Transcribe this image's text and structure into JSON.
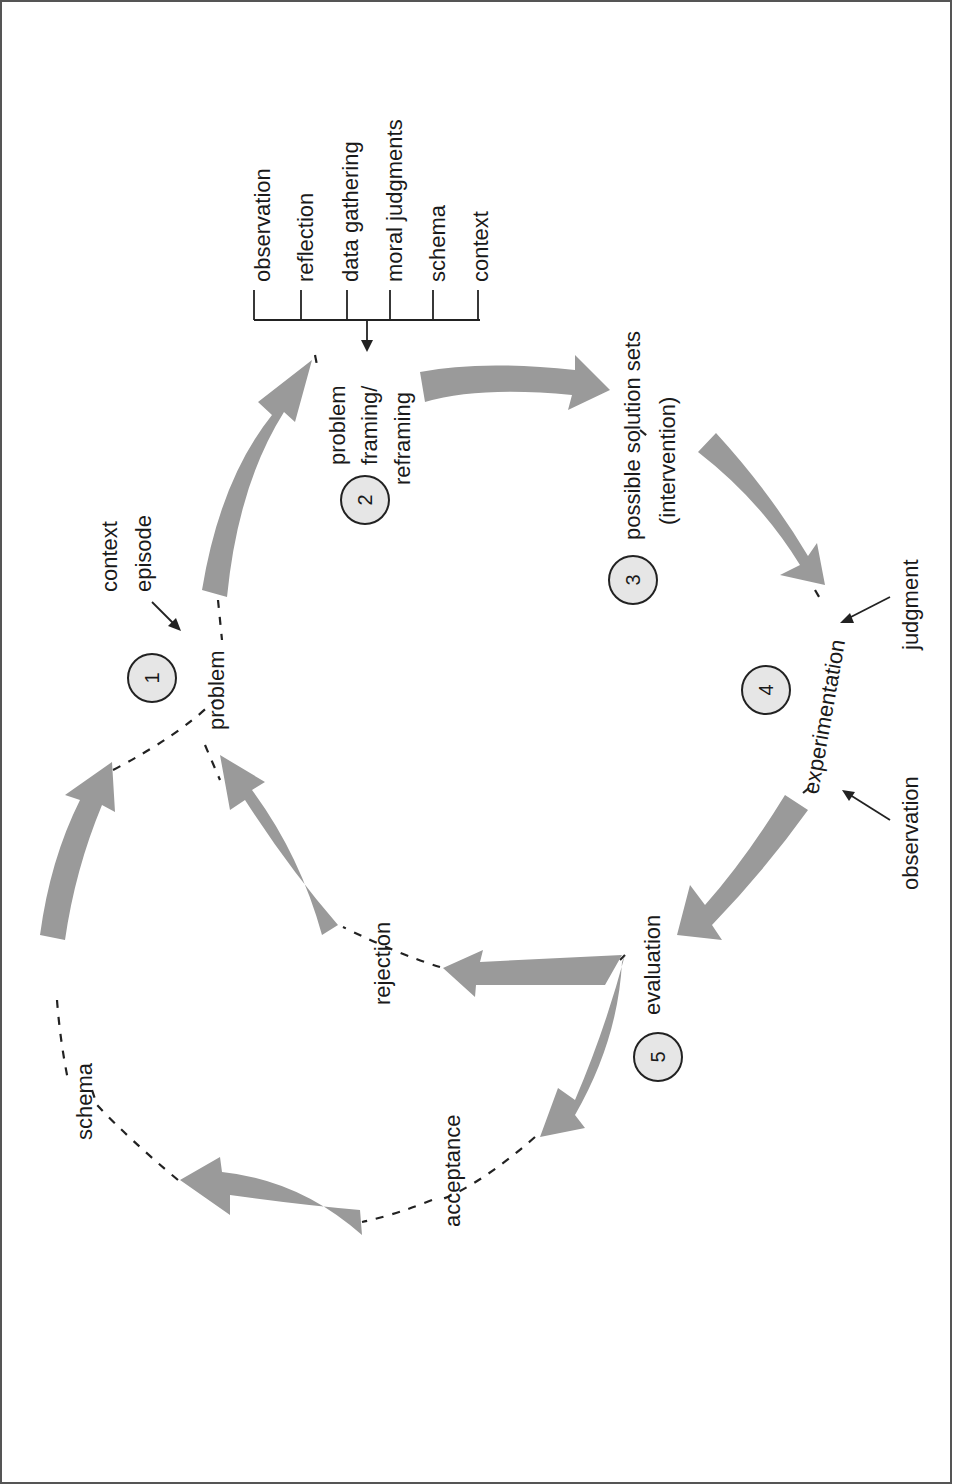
{
  "diagram": {
    "orientation": "rotated-90-ccw",
    "stages": [
      {
        "number": "1",
        "label": "problem"
      },
      {
        "number": "2",
        "label_lines": [
          "problem",
          "framing/",
          "reframing"
        ]
      },
      {
        "number": "3",
        "label_lines": [
          "possible solution sets",
          "(intervention)"
        ]
      },
      {
        "number": "4",
        "label": "experimentation"
      },
      {
        "number": "5",
        "label": "evaluation"
      }
    ],
    "inputs_to_problem": {
      "lines": [
        "context",
        "episode"
      ]
    },
    "framing_inputs": [
      "observation",
      "reflection",
      "data gathering",
      "moral judgments",
      "schema",
      "context"
    ],
    "experimentation_inputs": {
      "top": "judgment",
      "bottom": "observation"
    },
    "outcomes": {
      "rejection": "rejection",
      "acceptance": "acceptance",
      "schema": "schema"
    },
    "colors": {
      "arrow": "#9a9a9a",
      "stroke": "#222222",
      "circle_fill": "#e6e6e6",
      "border": "#555555"
    }
  }
}
